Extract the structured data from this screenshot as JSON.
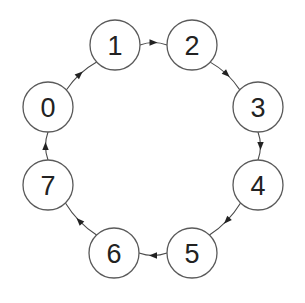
{
  "diagram": {
    "type": "directed-ring",
    "nodes": [
      {
        "id": "0",
        "label": "0",
        "x": 48,
        "y": 107
      },
      {
        "id": "1",
        "label": "1",
        "x": 115,
        "y": 45
      },
      {
        "id": "2",
        "label": "2",
        "x": 192,
        "y": 45
      },
      {
        "id": "3",
        "label": "3",
        "x": 258,
        "y": 107
      },
      {
        "id": "4",
        "label": "4",
        "x": 258,
        "y": 185
      },
      {
        "id": "5",
        "label": "5",
        "x": 192,
        "y": 253
      },
      {
        "id": "6",
        "label": "6",
        "x": 114,
        "y": 253
      },
      {
        "id": "7",
        "label": "7",
        "x": 48,
        "y": 185
      }
    ],
    "edges": [
      {
        "from": "0",
        "to": "1"
      },
      {
        "from": "1",
        "to": "2"
      },
      {
        "from": "2",
        "to": "3"
      },
      {
        "from": "3",
        "to": "4"
      },
      {
        "from": "4",
        "to": "5"
      },
      {
        "from": "5",
        "to": "6"
      },
      {
        "from": "6",
        "to": "7"
      },
      {
        "from": "7",
        "to": "0"
      }
    ],
    "node_radius": 25,
    "colors": {
      "node_stroke": "#5a5a5a",
      "node_fill": "#ffffff",
      "label": "#222222",
      "edge": "#4a4a4a",
      "background": "#ffffff"
    }
  }
}
